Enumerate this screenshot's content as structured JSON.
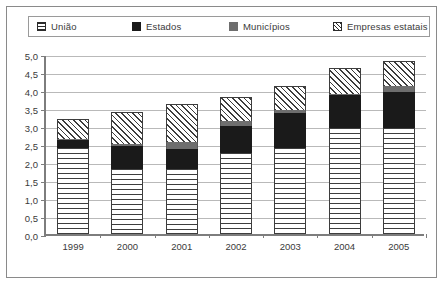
{
  "chart_data": {
    "type": "bar",
    "stacked": true,
    "title": "",
    "subtitle": "",
    "xlabel": "",
    "ylabel": "",
    "categories": [
      "1999",
      "2000",
      "2001",
      "2002",
      "2003",
      "2004",
      "2005"
    ],
    "ylim": [
      0,
      5
    ],
    "ytick_step": 0.5,
    "ytick_labels": [
      "0,0",
      "0,5",
      "1,0",
      "1,5",
      "2,0",
      "2,5",
      "3,0",
      "3,5",
      "4,0",
      "4,5",
      "5,0"
    ],
    "ytick_values": [
      0,
      0.5,
      1.0,
      1.5,
      2.0,
      2.5,
      3.0,
      3.5,
      4.0,
      4.5,
      5.0
    ],
    "grid": true,
    "legend_position": "top",
    "series": [
      {
        "name": "União",
        "pattern": "horizontal-lines",
        "color": "#ffffff",
        "values": [
          2.4,
          1.8,
          1.8,
          2.25,
          2.4,
          2.95,
          2.95
        ]
      },
      {
        "name": "Estados",
        "pattern": "solid",
        "color": "#1a1a1a",
        "values": [
          0.2,
          0.65,
          0.55,
          0.75,
          0.95,
          0.9,
          1.0
        ]
      },
      {
        "name": "Municípios",
        "pattern": "solid",
        "color": "#6e6e6e",
        "values": [
          0.05,
          0.05,
          0.2,
          0.15,
          0.1,
          0.05,
          0.15
        ]
      },
      {
        "name": "Empresas estatais",
        "pattern": "diagonal-hatch",
        "color": "#ffffff",
        "values": [
          0.55,
          0.9,
          1.05,
          0.65,
          0.65,
          0.7,
          0.7
        ]
      }
    ],
    "totals": [
      3.2,
      3.4,
      3.6,
      3.8,
      4.1,
      4.6,
      4.8
    ]
  },
  "legend": {
    "items": [
      {
        "label": "União",
        "swatch": "horizontal-lines-swatch"
      },
      {
        "label": "Estados",
        "swatch": "black-square-swatch"
      },
      {
        "label": "Municípios",
        "swatch": "gray-square-swatch"
      },
      {
        "label": "Empresas estatais",
        "swatch": "diagonal-hatch-swatch"
      }
    ]
  }
}
